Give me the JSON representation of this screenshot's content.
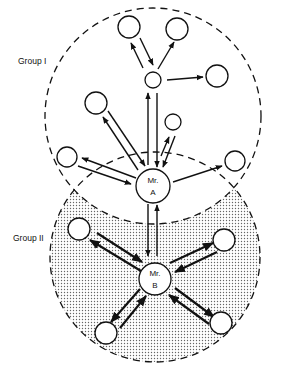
{
  "diagram": {
    "type": "sociogram",
    "groups": [
      {
        "id": "group1",
        "label": "Group I",
        "shaded": false
      },
      {
        "id": "group2",
        "label": "Group II",
        "shaded": true
      }
    ],
    "central_nodes": [
      {
        "id": "mrA",
        "line1": "Mr.",
        "line2": "A",
        "group": "Group I"
      },
      {
        "id": "mrB",
        "line1": "Mr.",
        "line2": "B",
        "group": "Group II"
      }
    ],
    "edges": [
      {
        "from": "mrA",
        "to": "hub",
        "type": "bidirectional"
      },
      {
        "from": "hub",
        "to": "top-left",
        "type": "bidirectional"
      },
      {
        "from": "hub",
        "to": "top-right",
        "type": "outgoing"
      },
      {
        "from": "hub",
        "to": "right",
        "type": "outgoing"
      },
      {
        "from": "mrA",
        "to": "upper-left",
        "type": "bidirectional"
      },
      {
        "from": "mrA",
        "to": "small-right",
        "type": "bidirectional"
      },
      {
        "from": "mrA",
        "to": "left",
        "type": "bidirectional"
      },
      {
        "from": "mrA",
        "to": "far-right",
        "type": "outgoing"
      },
      {
        "from": "mrA",
        "to": "mrB",
        "type": "bidirectional"
      },
      {
        "from": "mrB",
        "to": "g2-upper-left",
        "type": "bidirectional"
      },
      {
        "from": "mrB",
        "to": "g2-upper-right",
        "type": "bidirectional"
      },
      {
        "from": "mrB",
        "to": "g2-lower-left",
        "type": "bidirectional"
      },
      {
        "from": "mrB",
        "to": "g2-lower-right",
        "type": "bidirectional"
      }
    ],
    "colors": {
      "stroke": "#111111",
      "shading_dot": "#555555",
      "background": "#ffffff"
    }
  }
}
